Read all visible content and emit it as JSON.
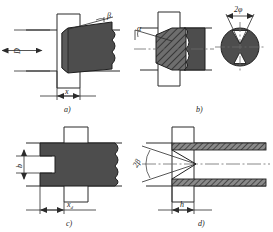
{
  "figure": {
    "type": "engineering-drawing",
    "title": "",
    "background": "#ffffff",
    "line_color": "#2b2b2b",
    "fill_color": "#4a4a4a",
    "hatch_color": "#3a3a3a",
    "panels": [
      {
        "id": "a",
        "caption": "a)",
        "labels": [
          {
            "key": "D",
            "text": "D",
            "orientation": "vertical"
          },
          {
            "key": "x",
            "text": "x",
            "orientation": "horizontal"
          },
          {
            "key": "beta",
            "text": "β",
            "orientation": "horizontal"
          }
        ]
      },
      {
        "id": "b",
        "caption": "b)",
        "labels": [
          {
            "key": "alpha",
            "text": "α",
            "orientation": "horizontal"
          },
          {
            "key": "twophi",
            "text": "2φ",
            "orientation": "horizontal"
          }
        ]
      },
      {
        "id": "c",
        "caption": "c)",
        "labels": [
          {
            "key": "b",
            "text": "b",
            "orientation": "vertical"
          },
          {
            "key": "xd",
            "text": "x",
            "sub": "d",
            "orientation": "horizontal"
          }
        ]
      },
      {
        "id": "d",
        "caption": "d)",
        "labels": [
          {
            "key": "twobeta",
            "text": "2β",
            "orientation": "rotated"
          },
          {
            "key": "h",
            "text": "h",
            "orientation": "horizontal"
          }
        ]
      }
    ]
  }
}
